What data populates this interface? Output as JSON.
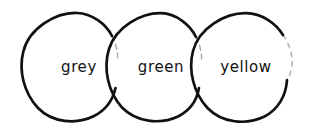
{
  "diagram": {
    "style": "hand-drawn marker sketch",
    "background_color": "#ffffff",
    "stroke_color": "#111111",
    "circles": [
      {
        "id": "circle-grey",
        "label": "grey",
        "label_color": "#111111",
        "center_x": 79,
        "center_y": 66,
        "radius": 56
      },
      {
        "id": "circle-green",
        "label": "green",
        "label_color": "#111111",
        "center_x": 161,
        "center_y": 66,
        "radius": 55
      },
      {
        "id": "circle-yellow",
        "label": "yellow",
        "label_color": "#111111",
        "center_x": 245,
        "center_y": 66,
        "radius": 56
      }
    ]
  }
}
